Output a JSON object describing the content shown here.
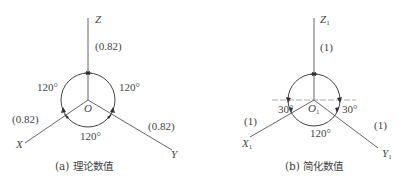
{
  "figures": [
    {
      "id": "a",
      "caption": "(a) 理论数值",
      "origin_label": "O",
      "axes": {
        "z": {
          "label": "Z",
          "coef": "(0.82)"
        },
        "x": {
          "label": "X",
          "coef": "(0.82)"
        },
        "y": {
          "label": "Y",
          "coef": "(0.82)"
        }
      },
      "angles": {
        "left": "120°",
        "right": "120°",
        "bottom": "120°"
      }
    },
    {
      "id": "b",
      "caption": "(b) 简化数值",
      "origin_label": "O",
      "origin_sub": "1",
      "axes": {
        "z": {
          "label": "Z",
          "sub": "1",
          "coef": "(1)"
        },
        "x": {
          "label": "X",
          "sub": "1",
          "coef": "(1)"
        },
        "y": {
          "label": "Y",
          "sub": "1",
          "coef": "(1)"
        }
      },
      "angles": {
        "left": "30°",
        "right": "30°",
        "bottom": "120°"
      }
    }
  ],
  "colors": {
    "line": "#666666",
    "text": "#444444",
    "background": "#ffffff"
  }
}
